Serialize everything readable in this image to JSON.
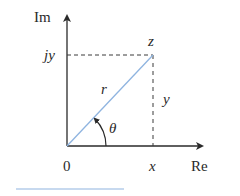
{
  "diagram": {
    "type": "complex-plane-polar-representation",
    "axes": {
      "vertical_label": "Im",
      "horizontal_label": "Re",
      "origin_label": "0"
    },
    "point": {
      "label": "z",
      "x_label": "x",
      "y_label": "y",
      "imag_label": "jy",
      "magnitude_label": "r",
      "angle_label": "θ"
    },
    "colors": {
      "axes": "#2a2a2a",
      "vector": "#8fb4e0",
      "dashed": "#3a3a3a",
      "underline": "#8fb4e0"
    }
  }
}
